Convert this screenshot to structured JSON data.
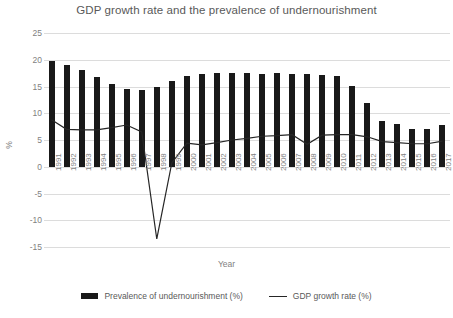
{
  "chart_data": {
    "type": "bar",
    "title": "GDP growth rate and the prevalence of undernourishment",
    "xlabel": "Year",
    "ylabel": "%",
    "ylim": [
      -15,
      25
    ],
    "ytick_labels": [
      "25",
      "20",
      "15",
      "10",
      "5",
      "0",
      "-5",
      "-10",
      "-15"
    ],
    "ytick_values": [
      25,
      20,
      15,
      10,
      5,
      0,
      -5,
      -10,
      -15
    ],
    "grid": true,
    "legend_position": "bottom",
    "categories": [
      "1991",
      "1992",
      "1993",
      "1994",
      "1995",
      "1996",
      "1997",
      "1998",
      "1999",
      "2000",
      "2001",
      "2002",
      "2003",
      "2004",
      "2005",
      "2006",
      "2007",
      "2008",
      "2009",
      "2010",
      "2011",
      "2012",
      "2013",
      "2014",
      "2015",
      "2016",
      "2017"
    ],
    "series": [
      {
        "name": "Prevalence of undernourishment (%)",
        "type": "bar",
        "color": "#191919",
        "values": [
          19.7,
          19.0,
          18.1,
          16.8,
          15.4,
          14.6,
          14.4,
          15.0,
          16.0,
          17.0,
          17.3,
          17.5,
          17.5,
          17.5,
          17.4,
          17.5,
          17.4,
          17.4,
          17.2,
          16.9,
          15.1,
          11.9,
          8.6,
          7.9,
          7.1,
          7.1,
          7.8
        ]
      },
      {
        "name": "GDP growth rate (%)",
        "type": "line",
        "color": "#262626",
        "values": [
          8.8,
          7.0,
          6.9,
          6.9,
          7.3,
          7.8,
          6.5,
          -13.5,
          0.7,
          4.4,
          4.1,
          4.5,
          5.0,
          5.3,
          5.7,
          5.8,
          6.0,
          4.2,
          5.9,
          6.0,
          6.0,
          5.6,
          4.7,
          4.5,
          4.3,
          4.3,
          4.8
        ]
      }
    ]
  },
  "legend": {
    "entries": [
      {
        "label": "Prevalence of undernourishment (%)",
        "marker": "bar-swatch"
      },
      {
        "label": "GDP growth rate (%)",
        "marker": "line-swatch"
      }
    ]
  }
}
